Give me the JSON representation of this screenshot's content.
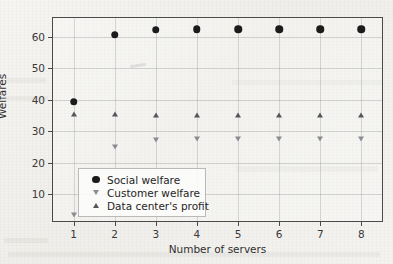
{
  "chart_data": {
    "type": "scatter",
    "title": "",
    "xlabel": "Number of servers",
    "ylabel": "Welfares",
    "x": [
      1,
      2,
      3,
      4,
      5,
      6,
      7,
      8
    ],
    "xticklabels": [
      "1",
      "2",
      "3",
      "4",
      "5",
      "6",
      "7",
      "8"
    ],
    "yticks": [
      10,
      20,
      30,
      40,
      50,
      60
    ],
    "yticklabels": [
      "10",
      "20",
      "30",
      "40",
      "50",
      "60"
    ],
    "xlim": [
      0.5,
      8.5
    ],
    "ylim": [
      1.5,
      66.0
    ],
    "grid": true,
    "legend_position": "lower left",
    "series": [
      {
        "name": "Social welfare",
        "marker": "circle",
        "color": "#1b1b1b",
        "values": [
          39.4,
          60.6,
          62.2,
          62.4,
          62.4,
          62.4,
          62.4,
          62.4
        ]
      },
      {
        "name": "Customer welfare",
        "marker": "triangle-down",
        "color": "#8b8c92",
        "values": [
          3.5,
          25.1,
          27.2,
          27.4,
          27.4,
          27.4,
          27.4,
          27.4
        ]
      },
      {
        "name": "Data center's profit",
        "marker": "triangle-up",
        "color": "#55565c",
        "values": [
          35.4,
          35.5,
          35.3,
          35.2,
          35.1,
          35.1,
          35.1,
          35.1
        ]
      }
    ]
  },
  "legend": {
    "entries": [
      {
        "label": "Social welfare",
        "marker": "circle"
      },
      {
        "label": "Customer welfare",
        "marker": "triangle-down"
      },
      {
        "label": "Data center's profit",
        "marker": "triangle-up"
      }
    ]
  },
  "axes": {
    "x_title": "Number of servers",
    "y_title": "Welfares"
  }
}
